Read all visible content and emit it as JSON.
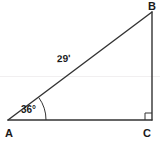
{
  "figure": {
    "background_color": "#ffffff",
    "stroke_color": "#333333",
    "text_color": "#1a1a1a",
    "vertices": [
      {
        "name": "A",
        "label": "A",
        "x": 8,
        "y": 120,
        "position": "bottom-left"
      },
      {
        "name": "B",
        "label": "B",
        "x": 152,
        "y": 12,
        "position": "top-right"
      },
      {
        "name": "C",
        "label": "C",
        "x": 152,
        "y": 120,
        "position": "bottom-right"
      }
    ],
    "sides": [
      {
        "name": "hypotenuse-ab",
        "from": "A",
        "to": "B",
        "label": "29'",
        "label_shown": true
      },
      {
        "name": "vertical-bc",
        "from": "B",
        "to": "C",
        "label": "",
        "label_shown": false
      },
      {
        "name": "base-ac",
        "from": "A",
        "to": "C",
        "label": "",
        "label_shown": false
      }
    ],
    "angles": [
      {
        "name": "angle-a",
        "at": "A",
        "label": "36°",
        "value": 36,
        "unit": "degrees",
        "marker": "arc"
      },
      {
        "name": "angle-c",
        "at": "C",
        "label": "",
        "value": 90,
        "unit": "degrees",
        "marker": "square"
      }
    ],
    "labels": {
      "vertex_a": "A",
      "vertex_b": "B",
      "vertex_c": "C",
      "hypotenuse_measure": "29'",
      "angle_a_measure": "36°"
    }
  }
}
